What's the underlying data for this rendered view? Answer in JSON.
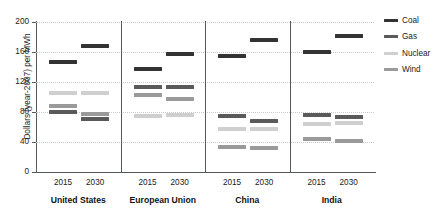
{
  "chart_data": {
    "type": "scatter",
    "title": "",
    "xlabel": "",
    "ylabel": "Dollars (year-2007) per MWh",
    "ylim": [
      0,
      200
    ],
    "yticks": [
      0,
      40,
      80,
      120,
      160,
      200
    ],
    "ytick_labels": [
      "0",
      "40",
      "80",
      "120",
      "160",
      "200"
    ],
    "grid": true,
    "legend_position": "right",
    "marker_style": "horizontal-dash",
    "series": [
      {
        "name": "Coal",
        "color": "#333333"
      },
      {
        "name": "Gas",
        "color": "#5a5a5a"
      },
      {
        "name": "Nuclear",
        "color": "#cfcfcf"
      },
      {
        "name": "Wind",
        "color": "#9a9a9a"
      }
    ],
    "groups": [
      {
        "region": "United States",
        "columns": [
          {
            "year": "2015",
            "values": {
              "Coal": 147,
              "Gas": 80,
              "Nuclear": 105,
              "Wind": 88
            }
          },
          {
            "year": "2030",
            "values": {
              "Coal": 168,
              "Gas": 71,
              "Nuclear": 105,
              "Wind": 78
            }
          }
        ]
      },
      {
        "region": "European Union",
        "columns": [
          {
            "year": "2015",
            "values": {
              "Coal": 137,
              "Gas": 113,
              "Nuclear": 75,
              "Wind": 103
            }
          },
          {
            "year": "2030",
            "values": {
              "Coal": 157,
              "Gas": 113,
              "Nuclear": 76,
              "Wind": 97
            }
          }
        ]
      },
      {
        "region": "China",
        "columns": [
          {
            "year": "2015",
            "values": {
              "Coal": 155,
              "Gas": 75,
              "Nuclear": 58,
              "Wind": 33
            }
          },
          {
            "year": "2030",
            "values": {
              "Coal": 176,
              "Gas": 68,
              "Nuclear": 57,
              "Wind": 32
            }
          }
        ]
      },
      {
        "region": "India",
        "columns": [
          {
            "year": "2015",
            "values": {
              "Coal": 160,
              "Gas": 76,
              "Nuclear": 64,
              "Wind": 44
            }
          },
          {
            "year": "2030",
            "values": {
              "Coal": 182,
              "Gas": 73,
              "Nuclear": 66,
              "Wind": 42
            }
          }
        ]
      }
    ]
  },
  "axis": {
    "y_title": "Dollars (year-2007) per MWh"
  },
  "legend": {
    "items": [
      {
        "label": "Coal"
      },
      {
        "label": "Gas"
      },
      {
        "label": "Nuclear"
      },
      {
        "label": "Wind"
      }
    ]
  }
}
